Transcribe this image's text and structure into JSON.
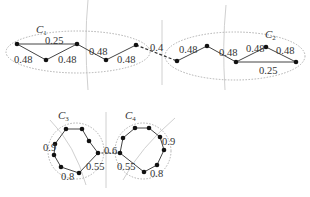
{
  "diagram": {
    "colors": {
      "edge": "#444444",
      "node": "#111111",
      "cluster": "#b0b0b0",
      "divider": "#cccccc",
      "text": "#333333"
    },
    "clusters": [
      {
        "id": "C1",
        "label": "C",
        "sub": "1"
      },
      {
        "id": "C2",
        "label": "C",
        "sub": "2"
      },
      {
        "id": "C3",
        "label": "C",
        "sub": "3"
      },
      {
        "id": "C4",
        "label": "C",
        "sub": "4"
      }
    ],
    "edge_labels": {
      "c1_top": "0.25",
      "c1_a": "0.48",
      "c1_b": "0.48",
      "c1_c": "0.48",
      "c1_d": "0.48",
      "bridge_12": "0.4",
      "c2_a": "0.48",
      "c2_b": "0.48",
      "c2_c": "0.48",
      "c2_d": "0.48",
      "c2_bottom": "0.25",
      "c3_left": "0.9",
      "c3_bottom": "0.8",
      "c3_right": "0.55",
      "bridge_34": "0.6",
      "c4_left": "0.55",
      "c4_bottom": "0.8",
      "c4_right": "0.9"
    }
  }
}
